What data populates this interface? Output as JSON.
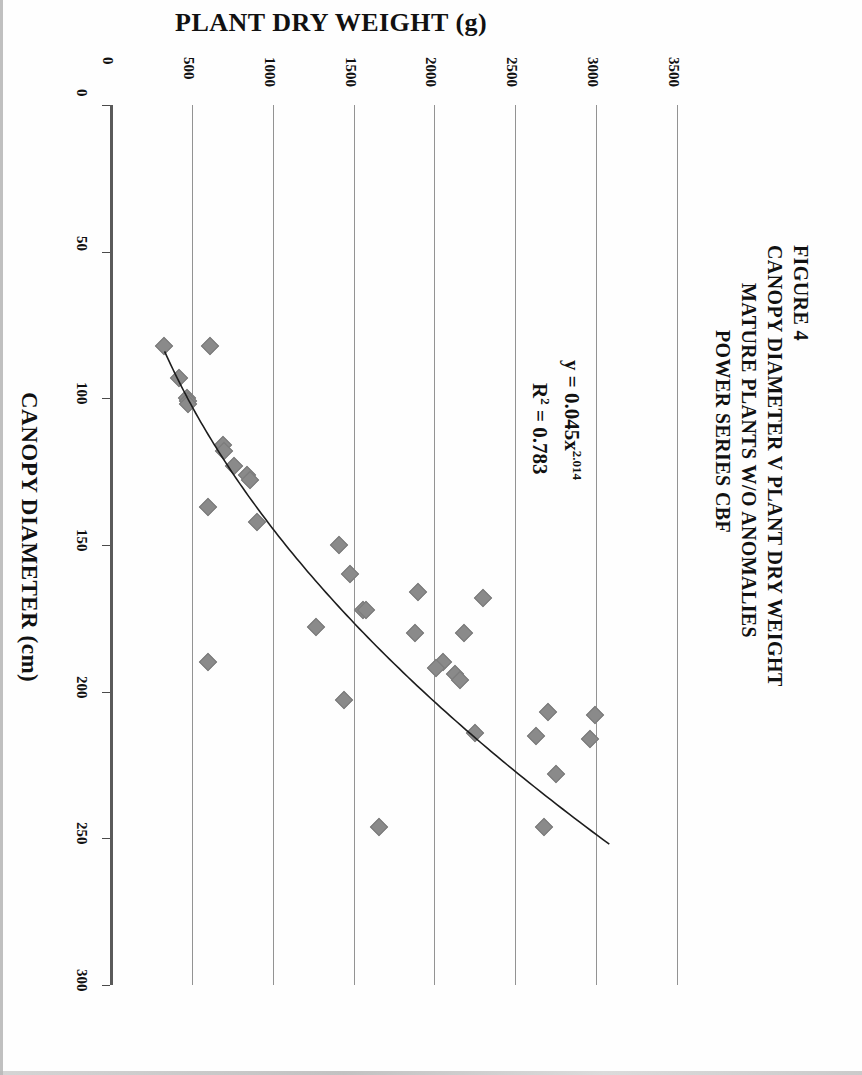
{
  "figure": {
    "number_label": "FIGURE 4",
    "title_lines": [
      "CANOPY DIAMETER V PLANT DRY WEIGHT",
      "MATURE PLANTS W/O ANOMALIES",
      "POWER SERIES CBF"
    ]
  },
  "equation": {
    "line1_prefix": "y = 0.045x",
    "line1_exponent": "2.014",
    "line2_prefix": "R",
    "line2_superscript": "2",
    "line2_suffix": " = 0.783"
  },
  "chart_data": {
    "type": "scatter",
    "xlabel": "CANOPY DIAMETER (cm)",
    "ylabel": "PLANT DRY WEIGHT (g)",
    "xlim": [
      0,
      300
    ],
    "ylim": [
      0,
      3500
    ],
    "xticks": [
      "0",
      "50",
      "100",
      "150",
      "200",
      "250",
      "300"
    ],
    "yticks": [
      "0",
      "500",
      "1000",
      "1500",
      "2000",
      "2500",
      "3000",
      "3500"
    ],
    "grid": "vertical-gridlines-on-value-axis",
    "legend": "none",
    "marker": "diamond",
    "marker_color": "#8a8a8a",
    "trendline": {
      "kind": "power",
      "label": "y = 0.045x^2.014",
      "r_squared": 0.783,
      "coefficient": 0.045,
      "exponent": 2.014
    },
    "points": [
      {
        "x": 82,
        "y": 330
      },
      {
        "x": 82,
        "y": 615
      },
      {
        "x": 93,
        "y": 420
      },
      {
        "x": 100,
        "y": 470
      },
      {
        "x": 101,
        "y": 475
      },
      {
        "x": 102,
        "y": 478
      },
      {
        "x": 116,
        "y": 690
      },
      {
        "x": 118,
        "y": 700
      },
      {
        "x": 123,
        "y": 760
      },
      {
        "x": 126,
        "y": 840
      },
      {
        "x": 128,
        "y": 860
      },
      {
        "x": 137,
        "y": 600
      },
      {
        "x": 142,
        "y": 905
      },
      {
        "x": 150,
        "y": 1410
      },
      {
        "x": 160,
        "y": 1480
      },
      {
        "x": 166,
        "y": 1900
      },
      {
        "x": 168,
        "y": 2300
      },
      {
        "x": 172,
        "y": 1560
      },
      {
        "x": 172,
        "y": 1575
      },
      {
        "x": 178,
        "y": 1270
      },
      {
        "x": 180,
        "y": 2180
      },
      {
        "x": 180,
        "y": 1880
      },
      {
        "x": 190,
        "y": 600
      },
      {
        "x": 190,
        "y": 2050
      },
      {
        "x": 192,
        "y": 2010
      },
      {
        "x": 194,
        "y": 2130
      },
      {
        "x": 196,
        "y": 2160
      },
      {
        "x": 203,
        "y": 1440
      },
      {
        "x": 207,
        "y": 2700
      },
      {
        "x": 208,
        "y": 2990
      },
      {
        "x": 214,
        "y": 2250
      },
      {
        "x": 215,
        "y": 2630
      },
      {
        "x": 216,
        "y": 2960
      },
      {
        "x": 228,
        "y": 2750
      },
      {
        "x": 246,
        "y": 1660
      },
      {
        "x": 246,
        "y": 2680
      }
    ]
  }
}
